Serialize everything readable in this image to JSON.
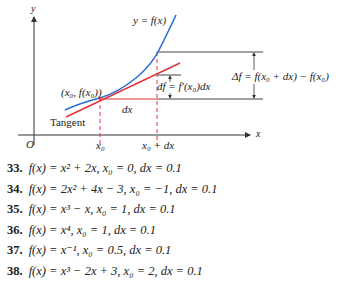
{
  "figure": {
    "axis_labels": {
      "y": "y",
      "x": "x",
      "origin": "O"
    },
    "curve_label": "y = f(x)",
    "point_label": "(x0, f(x0))",
    "point_label_display": "(x₀, f(x₀))",
    "tangent_label": "Tangent",
    "dx_label": "dx",
    "x0_label": "x₀",
    "x0_plus_dx_label": "x₀ + dx",
    "df_label": "df = f′(x₀)dx",
    "delta_f_label": "Δf = f(x₀ + dx) − f(x₀)",
    "colors": {
      "curve": "#2a6fd6",
      "tangent": "#e0343a",
      "axes": "#333333",
      "dashed": "#e0343a"
    }
  },
  "exercises": [
    {
      "number": "33.",
      "text": "f(x) = x² + 2x,   x₀ = 0,   dx = 0.1"
    },
    {
      "number": "34.",
      "text": "f(x) = 2x² + 4x − 3,   x₀ = −1,   dx = 0.1"
    },
    {
      "number": "35.",
      "text": "f(x) = x³ − x,   x₀ = 1,   dx = 0.1"
    },
    {
      "number": "36.",
      "text": "f(x) = x⁴,   x₀ = 1,   dx = 0.1"
    },
    {
      "number": "37.",
      "text": "f(x) = x⁻¹,   x₀ = 0.5,   dx = 0.1"
    },
    {
      "number": "38.",
      "text": "f(x) = x³ − 2x + 3,   x₀ = 2,   dx = 0.1"
    }
  ]
}
